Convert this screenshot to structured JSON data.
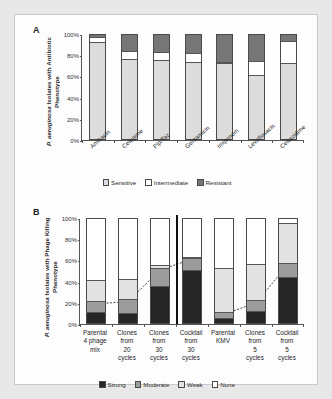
{
  "figure": {
    "panels": [
      {
        "letter": "A",
        "ytitle_line1": "P. aeruginosa Isolates with",
        "ytitle_line2": "Antibiotic Phenotype"
      },
      {
        "letter": "B",
        "ytitle_line1": "P. aeruginosa Isolates with",
        "ytitle_line2": "Phage Killing Phenotype"
      }
    ]
  },
  "chart_data": [
    {
      "type": "bar",
      "id": "panel-a",
      "stacked": true,
      "title": "",
      "xlabel": "",
      "ylabel": "P. aeruginosa Isolates with Antibiotic Phenotype",
      "ylim": [
        0,
        100
      ],
      "yticks": [
        "0%",
        "20%",
        "40%",
        "60%",
        "80%",
        "100%"
      ],
      "ytick_values": [
        0,
        20,
        40,
        60,
        80,
        100
      ],
      "grid": false,
      "legend_position": "bottom",
      "categories": [
        "Amikacin",
        "Cefepime",
        "Pip/Taz",
        "Gentamicin",
        "Imipenem",
        "Levofloxacin",
        "Ceftazidime"
      ],
      "series": [
        {
          "name": "Sensitive",
          "color": "#dcdcdc",
          "values": [
            92,
            76,
            75,
            73,
            72,
            61,
            72
          ]
        },
        {
          "name": "Intermediate",
          "color": "#ffffff",
          "values": [
            5,
            8,
            8,
            9,
            1,
            13,
            21
          ]
        },
        {
          "name": "Resistant",
          "color": "#767676",
          "values": [
            3,
            16,
            17,
            18,
            27,
            26,
            7
          ]
        }
      ]
    },
    {
      "type": "bar",
      "id": "panel-b",
      "stacked": true,
      "title": "",
      "xlabel": "",
      "ylabel": "P. aeruginosa Isolates with Phage Killing Phenotype",
      "ylim": [
        0,
        100
      ],
      "yticks": [
        "0%",
        "20%",
        "40%",
        "60%",
        "80%",
        "100%"
      ],
      "ytick_values": [
        0,
        20,
        40,
        60,
        80,
        100
      ],
      "grid": false,
      "legend_position": "bottom",
      "group_divider_after_index": 3,
      "categories": [
        "Parental\n4 phage\nmix",
        "Clones\nfrom\n20\ncycles",
        "Clones\nfrom\n30\ncycles",
        "Cocktail\nfrom\n30\ncycles",
        "Parental\nKMV",
        "Clones\nfrom\n5\ncycles",
        "Cocktail\nfrom\n5\ncycles"
      ],
      "series": [
        {
          "name": "Strong",
          "color": "#262626",
          "values": [
            10,
            9,
            35,
            50,
            4,
            11,
            43
          ]
        },
        {
          "name": "Moderate",
          "color": "#9c9c9c",
          "values": [
            10,
            13,
            17,
            12,
            6,
            10,
            14
          ]
        },
        {
          "name": "Weak",
          "color": "#e2e2e2",
          "values": [
            20,
            19,
            3,
            1,
            42,
            35,
            38
          ]
        },
        {
          "name": "None",
          "color": "#ffffff",
          "values": [
            60,
            59,
            45,
            37,
            48,
            44,
            5
          ]
        }
      ],
      "trendline": {
        "name": "cumulative-strong-plus-moderate",
        "values": [
          20,
          22,
          52,
          62,
          10,
          21,
          57
        ]
      }
    }
  ]
}
